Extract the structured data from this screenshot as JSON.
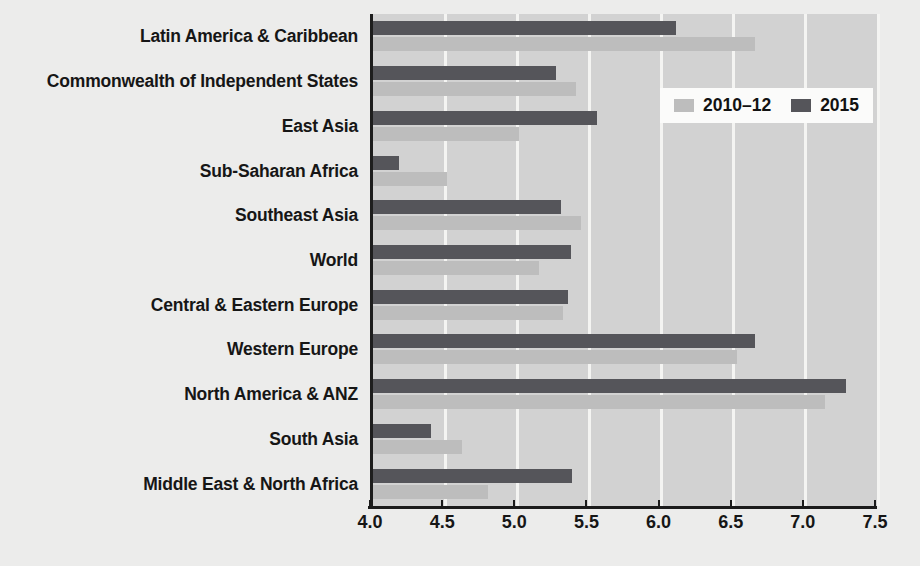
{
  "chart_data": {
    "type": "bar",
    "orientation": "horizontal",
    "title": "",
    "subtitle": "",
    "xlabel": "",
    "ylabel": "",
    "xlim": [
      4.0,
      7.5
    ],
    "xticks": [
      "4.0",
      "4.5",
      "5.0",
      "5.5",
      "6.0",
      "6.5",
      "7.0",
      "7.5"
    ],
    "xtick_values": [
      4.0,
      4.5,
      5.0,
      5.5,
      6.0,
      6.5,
      7.0,
      7.5
    ],
    "grid": true,
    "grid_axis": "x",
    "legend_position": "upper right",
    "categories": [
      "Latin America & Caribbean",
      "Commonwealth of Independent States",
      "East Asia",
      "Sub-Saharan Africa",
      "Southeast Asia",
      "World",
      "Central & Eastern Europe",
      "Western Europe",
      "North America & ANZ",
      "South Asia",
      "Middle East & North Africa"
    ],
    "series": [
      {
        "name": "2010–12",
        "color": "#bdbdbd",
        "values": [
          6.65,
          5.41,
          5.01,
          4.51,
          5.44,
          5.15,
          5.32,
          6.52,
          7.13,
          4.62,
          4.8
        ]
      },
      {
        "name": "2015",
        "color": "#55555a",
        "values": [
          6.1,
          5.27,
          5.55,
          4.18,
          5.3,
          5.37,
          5.35,
          6.65,
          7.28,
          4.4,
          5.38
        ]
      }
    ]
  },
  "legend": {
    "items": [
      {
        "label": "2010–12",
        "swatch": "light"
      },
      {
        "label": "2015",
        "swatch": "dark"
      }
    ]
  },
  "colors": {
    "plot_background": "#d2d2d2",
    "page_background": "#ececeb",
    "gridline": "#f4f4f2",
    "axis": "#1b1b1b",
    "series_2010_12": "#bdbdbd",
    "series_2015": "#55555a",
    "text": "#161616"
  }
}
